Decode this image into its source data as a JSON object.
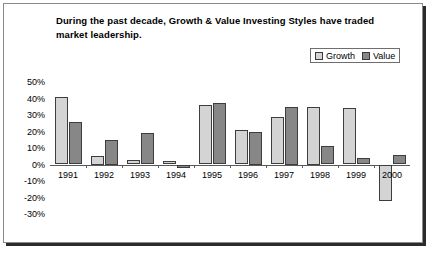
{
  "chart_data": {
    "type": "bar",
    "title": "During the past decade, Growth & Value Investing Styles have traded market leadership.",
    "xlabel": "",
    "ylabel": "",
    "categories": [
      "1991",
      "1992",
      "1993",
      "1994",
      "1995",
      "1996",
      "1997",
      "1998",
      "1999",
      "2000"
    ],
    "series": [
      {
        "name": "Growth",
        "color": "#d4d4d4",
        "values": [
          41,
          5,
          3,
          2,
          36,
          21,
          29,
          35,
          34,
          -22
        ]
      },
      {
        "name": "Value",
        "color": "#878787",
        "values": [
          26,
          15,
          19,
          -2,
          37,
          20,
          35,
          11,
          4,
          6
        ]
      }
    ],
    "ylim": [
      -30,
      50
    ],
    "ytick_values": [
      50,
      40,
      30,
      20,
      10,
      0,
      -10,
      -20,
      -30
    ],
    "ytick_labels": [
      "50%",
      "40%",
      "30%",
      "20%",
      "10%",
      "0%",
      "-10%",
      "-20%",
      "-30%"
    ],
    "grid": false,
    "legend_position": "top-right"
  }
}
